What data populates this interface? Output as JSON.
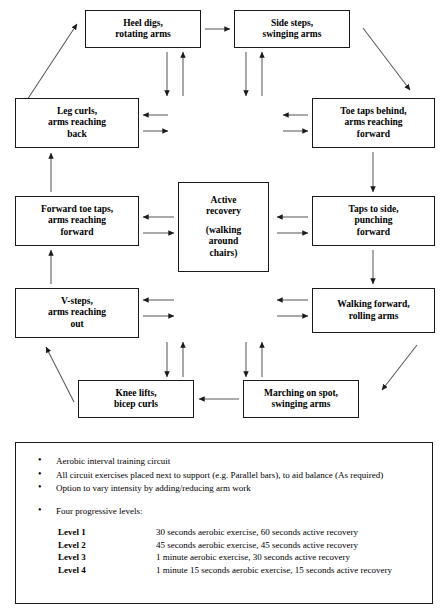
{
  "diagram": {
    "nodes": {
      "heel_digs": "Heel digs,\nrotating arms",
      "side_steps": "Side steps,\nswinging arms",
      "toe_taps_behind": "Toe taps behind,\narms reaching\nforward",
      "leg_curls": "Leg curls,\narms reaching\nback",
      "forward_toe_taps": "Forward toe taps,\narms reaching\nforward",
      "taps_to_side": "Taps to side,\npunching\nforward",
      "v_steps": "V-steps,\narms reaching\nout",
      "walking_forward": "Walking forward,\nrolling arms",
      "knee_lifts": "Knee lifts,\nbicep curls",
      "marching_on_spot": "Marching on spot,\nswinging arms",
      "active_recovery_line1": "Active",
      "active_recovery_line2": "recovery",
      "active_recovery_line3": "(walking",
      "active_recovery_line4": "around",
      "active_recovery_line5": "chairs)"
    }
  },
  "notes": {
    "bullets": [
      "Aerobic interval training circuit",
      "All circuit exercises placed next to support (e.g.  Parallel bars), to aid balance (As required)",
      "Option to vary intensity by adding/reducing arm work",
      "Four progressive levels:"
    ],
    "levels": [
      {
        "label": "Level 1",
        "desc": "30 seconds aerobic exercise, 60 seconds active recovery"
      },
      {
        "label": "Level 2",
        "desc": "45 seconds aerobic exercise, 45 seconds active recovery"
      },
      {
        "label": "Level 3",
        "desc": "1 minute aerobic exercise, 30 seconds active recovery"
      },
      {
        "label": "Level 4",
        "desc": "1 minute 15 seconds aerobic exercise, 15 seconds active recovery"
      }
    ]
  },
  "colors": {
    "stroke": "#1a1a1a",
    "background": "#ffffff",
    "text": "#000000"
  }
}
